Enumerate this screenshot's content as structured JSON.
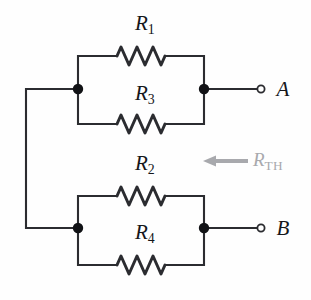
{
  "diagram": {
    "colors": {
      "wire": "#2b2c30",
      "node": "#111215",
      "label": "#15161a",
      "annotation": "#a8a9ad",
      "background": "#fefefe",
      "terminal_fill": "#ffffff"
    },
    "resistors": [
      {
        "id": "r1",
        "label_r": "R",
        "label_sub": "1",
        "x": 145,
        "y": 25,
        "wire_y": 56
      },
      {
        "id": "r3",
        "label_r": "R",
        "label_sub": "3",
        "x": 145,
        "y": 95,
        "wire_y": 124
      },
      {
        "id": "r2",
        "label_r": "R",
        "label_sub": "2",
        "x": 145,
        "y": 165,
        "wire_y": 196
      },
      {
        "id": "r4",
        "label_r": "R",
        "label_sub": "4",
        "x": 145,
        "y": 234,
        "wire_y": 265
      }
    ],
    "terminals": [
      {
        "id": "a",
        "label": "A",
        "x": 283,
        "y": 89
      },
      {
        "id": "b",
        "label": "B",
        "x": 283,
        "y": 228
      }
    ],
    "annotation": {
      "id": "rth",
      "label_r": "R",
      "label_sub": "TH",
      "x": 253,
      "y": 161,
      "arrow_from_x": 248,
      "arrow_to_x": 203,
      "arrow_y": 161
    },
    "nodes": [
      {
        "id": "top-left",
        "x": 78,
        "y": 89
      },
      {
        "id": "top-right",
        "x": 204,
        "y": 89
      },
      {
        "id": "bottom-left",
        "x": 78,
        "y": 228
      },
      {
        "id": "bottom-right",
        "x": 204,
        "y": 228
      }
    ]
  }
}
